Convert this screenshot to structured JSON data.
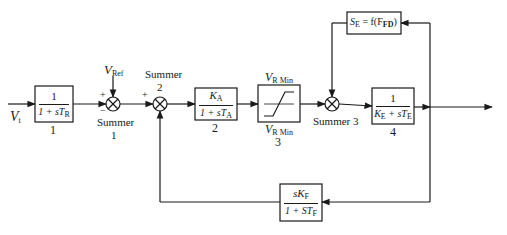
{
  "diagram": {
    "type": "block-diagram",
    "input": {
      "symbol": "V",
      "subscript": "t"
    },
    "reference": {
      "symbol": "V",
      "subscript": "Ref"
    },
    "blocks": [
      {
        "id": "1",
        "label": "1",
        "numerator": "1",
        "denominator_pre": "1 + sT",
        "denominator_sub": "R"
      },
      {
        "id": "2",
        "label": "2",
        "numerator_pre": "K",
        "numerator_sub": "A",
        "denominator_pre": "1 + sT",
        "denominator_sub": "A"
      },
      {
        "id": "3",
        "label": "3",
        "type": "limiter",
        "upper_pre": "V",
        "upper_sub": "R Min",
        "lower_pre": "V",
        "lower_sub": "R Min"
      },
      {
        "id": "4",
        "label": "4",
        "numerator": "1",
        "den_a": "K",
        "den_a_sub": "E",
        "den_b": " + sT",
        "den_b_sub": "E"
      },
      {
        "id": "se",
        "text_pre": "S",
        "text_sub": "E",
        "text_mid": " = f(F",
        "text_sub2": "FD",
        "text_end": ")"
      },
      {
        "id": "kf",
        "numerator_pre": "sK",
        "numerator_sub": "F",
        "denominator_pre": "1 + ST",
        "denominator_sub": "F"
      }
    ],
    "summers": [
      {
        "label_line1": "Summer",
        "label_line2": "1",
        "signs": [
          "+",
          "−"
        ]
      },
      {
        "label_line1": "Summer",
        "label_line2": "2",
        "signs": [
          "+"
        ]
      },
      {
        "label": "Summer 3"
      }
    ]
  }
}
